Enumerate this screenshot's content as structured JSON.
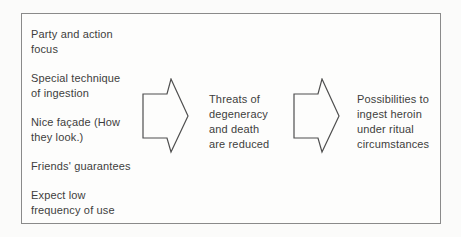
{
  "diagram": {
    "left_items": [
      {
        "text": "Party and action\nfocus"
      },
      {
        "text": "Special technique\nof ingestion"
      },
      {
        "text": "Nice façade (How\nthey look.)"
      },
      {
        "text": "Friends' guarantees"
      },
      {
        "text": "Expect low\nfrequency of use"
      }
    ],
    "middle_text": "Threats of\ndegeneracy\nand death\nare reduced",
    "right_text": "Possibilities to\ningest heroin\nunder ritual\ncircumstances",
    "arrow_icon": "right-block-arrow",
    "arrow_count": 2,
    "colors": {
      "bg": "#fbfbfa",
      "frame-bg": "#fdfdfc",
      "border": "#8a8a8a",
      "text": "#3d3d3d",
      "arrow": "#4f4f4f"
    }
  }
}
